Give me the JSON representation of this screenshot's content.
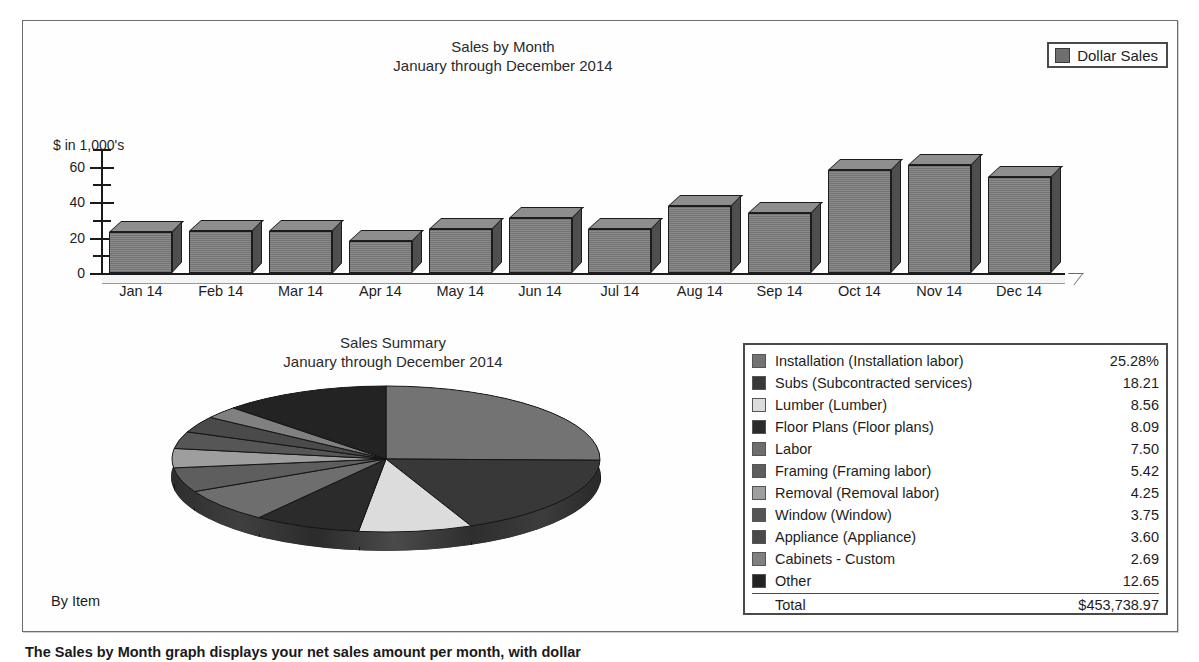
{
  "bar_chart": {
    "title": "Sales by Month\nJanuary through December 2014",
    "y_caption": "$ in 1,000's",
    "legend": {
      "label": "Dollar Sales",
      "swatch_color": "#6f6f6f"
    }
  },
  "pie_chart": {
    "title": "Sales Summary\nJanuary through December 2014",
    "footer_label": "By Item"
  },
  "legend_table": {
    "total_label": "Total",
    "total_value": "$453,738.97",
    "rows": [
      {
        "label": "Installation (Installation labor)",
        "value": "25.28%",
        "color": "#737373"
      },
      {
        "label": "Subs (Subcontracted services)",
        "value": "18.21",
        "color": "#383838"
      },
      {
        "label": "Lumber (Lumber)",
        "value": "8.56",
        "color": "#dcdcdc"
      },
      {
        "label": "Floor Plans (Floor plans)",
        "value": "8.09",
        "color": "#2b2b2b"
      },
      {
        "label": "Labor",
        "value": "7.50",
        "color": "#6e6e6e"
      },
      {
        "label": "Framing (Framing labor)",
        "value": "5.42",
        "color": "#5e5e5e"
      },
      {
        "label": "Removal (Removal labor)",
        "value": "4.25",
        "color": "#9e9e9e"
      },
      {
        "label": "Window (Window)",
        "value": "3.75",
        "color": "#565656"
      },
      {
        "label": "Appliance (Appliance)",
        "value": "3.60",
        "color": "#4a4a4a"
      },
      {
        "label": "Cabinets - Custom",
        "value": "2.69",
        "color": "#808080"
      },
      {
        "label": "Other",
        "value": "12.65",
        "color": "#232323"
      }
    ]
  },
  "footer": {
    "caption": "The Sales by Month graph displays your net sales amount per month, with dollar"
  },
  "chart_data": [
    {
      "type": "bar",
      "title": "Sales by Month — January through December 2014",
      "xlabel": "",
      "ylabel": "$ in 1,000's",
      "ylim": [
        0,
        70
      ],
      "yticks": [
        0,
        20,
        40,
        60
      ],
      "yticks_minor": [
        10,
        30,
        50,
        70
      ],
      "grid": false,
      "legend": [
        "Dollar Sales"
      ],
      "legend_position": "top-right",
      "categories": [
        "Jan 14",
        "Feb 14",
        "Mar 14",
        "Apr 14",
        "May 14",
        "Jun 14",
        "Jul 14",
        "Aug 14",
        "Sep 14",
        "Oct 14",
        "Nov 14",
        "Dec 14"
      ],
      "series": [
        {
          "name": "Dollar Sales",
          "values": [
            23,
            24,
            24,
            18,
            25,
            31,
            25,
            38,
            34,
            58,
            61,
            54
          ]
        }
      ]
    },
    {
      "type": "pie",
      "title": "Sales Summary — January through December 2014",
      "legend_position": "right",
      "total": "$453,738.97",
      "unit": "percent",
      "labels": [
        "Installation (Installation labor)",
        "Subs (Subcontracted services)",
        "Lumber (Lumber)",
        "Floor Plans (Floor plans)",
        "Labor",
        "Framing (Framing labor)",
        "Removal (Removal labor)",
        "Window (Window)",
        "Appliance (Appliance)",
        "Cabinets - Custom",
        "Other"
      ],
      "values": [
        25.28,
        18.21,
        8.56,
        8.09,
        7.5,
        5.42,
        4.25,
        3.75,
        3.6,
        2.69,
        12.65
      ],
      "colors": [
        "#737373",
        "#383838",
        "#dcdcdc",
        "#2b2b2b",
        "#6e6e6e",
        "#5e5e5e",
        "#9e9e9e",
        "#565656",
        "#4a4a4a",
        "#808080",
        "#232323"
      ]
    }
  ]
}
